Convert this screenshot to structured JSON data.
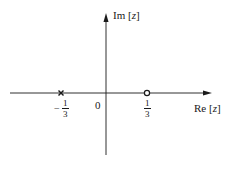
{
  "diagram": {
    "axes": {
      "real_label_prefix": "Re [",
      "real_label_var": "z",
      "real_label_suffix": "]",
      "imag_label_prefix": "Im [",
      "imag_label_var": "z",
      "imag_label_suffix": "]",
      "origin_label": "0"
    },
    "markers": [
      {
        "type": "pole",
        "symbol": "x",
        "position": "-1/3",
        "num": "1",
        "den": "3",
        "sign": "−"
      },
      {
        "type": "zero",
        "symbol": "o",
        "position": "1/3",
        "num": "1",
        "den": "3",
        "sign": ""
      }
    ],
    "colors": {
      "ink": "#1a1a1a",
      "background": "#ffffff"
    }
  }
}
